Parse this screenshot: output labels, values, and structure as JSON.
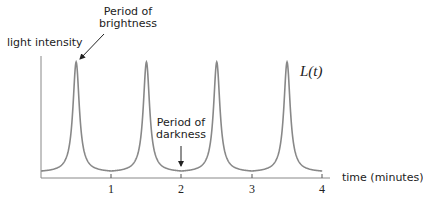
{
  "chart_data": {
    "type": "line",
    "title": "",
    "xlabel": "time (minutes)",
    "ylabel": "light intensity",
    "xlim": [
      0,
      4
    ],
    "x_ticks": [
      1,
      2,
      3,
      4
    ],
    "x_tick_labels": [
      "1",
      "2",
      "3",
      "4"
    ],
    "y_ticks": [],
    "grid": false,
    "legend": null,
    "series": [
      {
        "name": "L(t)",
        "color": "#888888",
        "description": "Periodic sharp peaks (period 1 minute) with peaks at t = 0.5, 1.5, 2.5, 3.5 and low flat minima near integer t",
        "x": [
          0,
          0.25,
          0.4,
          0.5,
          0.6,
          0.75,
          1.0,
          1.25,
          1.4,
          1.5,
          1.6,
          1.75,
          2.0,
          2.25,
          2.4,
          2.5,
          2.6,
          2.75,
          3.0,
          3.25,
          3.4,
          3.5,
          3.6,
          3.75,
          4.0
        ],
        "values": [
          0.07,
          0.15,
          0.4,
          1.0,
          0.4,
          0.15,
          0.07,
          0.15,
          0.4,
          1.0,
          0.4,
          0.15,
          0.07,
          0.15,
          0.4,
          1.0,
          0.4,
          0.15,
          0.07,
          0.15,
          0.4,
          1.0,
          0.4,
          0.15,
          0.07
        ]
      }
    ],
    "annotations": [
      {
        "text": "Period of brightness",
        "lines": [
          "Period of",
          "brightness"
        ],
        "points_to": {
          "x": 0.5,
          "y": "peak"
        }
      },
      {
        "text": "Period of darkness",
        "lines": [
          "Period of",
          "darkness"
        ],
        "points_to": {
          "x": 2.0,
          "y": "minimum"
        }
      }
    ],
    "series_label": "L(t)"
  },
  "labels": {
    "ylabel": "light intensity",
    "xlabel": "time (minutes)",
    "series": "L(t)",
    "bright_line1": "Period of",
    "bright_line2": "brightness",
    "dark_line1": "Period of",
    "dark_line2": "darkness",
    "tick1": "1",
    "tick2": "2",
    "tick3": "3",
    "tick4": "4"
  }
}
